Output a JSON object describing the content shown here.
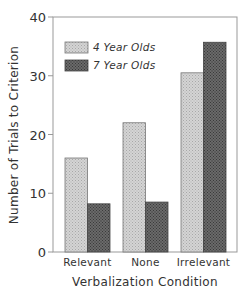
{
  "chart_data": {
    "type": "bar",
    "title": "",
    "xlabel": "Verbalization Condition",
    "ylabel": "Number of Trials to Criterion",
    "ylim": [
      0,
      40
    ],
    "yticks": [
      0,
      10,
      20,
      30,
      40
    ],
    "ytick_labels": [
      "0",
      "10",
      "20",
      "30",
      "40"
    ],
    "categories": [
      "Relevant",
      "None",
      "Irrelevant"
    ],
    "series": [
      {
        "name": "4 Year Olds",
        "values": [
          16,
          22,
          30.5
        ],
        "color": "#c8c8c8"
      },
      {
        "name": "7 Year Olds",
        "values": [
          8.2,
          8.5,
          35.7
        ],
        "color": "#5a5a5a"
      }
    ],
    "legend_position": "upper left",
    "grid": false
  }
}
